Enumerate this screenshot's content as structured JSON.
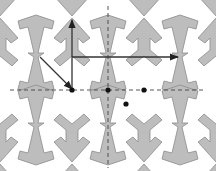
{
  "diagram": {
    "colors": {
      "tile_fill": "#bdbdbd",
      "tile_stroke": "#8c8c8c",
      "axis": "#444444",
      "vector": "#333333",
      "point": "#111111",
      "background": "#ffffff"
    },
    "tiling": {
      "cell_width": 72,
      "cell_height": 70,
      "origin": [
        72,
        90
      ]
    },
    "axes": [
      {
        "name": "horizontal-axis",
        "from": [
          10,
          90
        ],
        "to": [
          206,
          90
        ],
        "style": "dashed"
      },
      {
        "name": "vertical-axis",
        "from": [
          108,
          6
        ],
        "to": [
          108,
          168
        ],
        "style": "dashed"
      }
    ],
    "vectors": [
      {
        "name": "vertical-vector",
        "from": [
          72,
          90
        ],
        "to": [
          72,
          20
        ]
      },
      {
        "name": "diagonal-vector",
        "from": [
          40,
          57
        ],
        "to": [
          72,
          89
        ]
      },
      {
        "name": "horizontal-vector",
        "from": [
          72,
          57
        ],
        "to": [
          178,
          57
        ]
      }
    ],
    "points": [
      {
        "name": "point-a",
        "x": 72,
        "y": 90
      },
      {
        "name": "point-b",
        "x": 108,
        "y": 90
      },
      {
        "name": "point-c",
        "x": 144,
        "y": 90
      },
      {
        "name": "point-d",
        "x": 126,
        "y": 104
      }
    ]
  }
}
